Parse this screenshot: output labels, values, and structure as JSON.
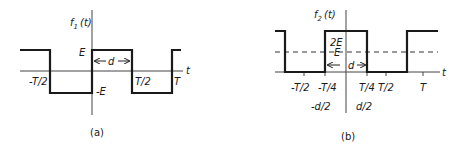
{
  "diagram_a": {
    "caption": "(a)",
    "y_label": "f",
    "y_label_sub": "1",
    "y_label_arg": "(t)",
    "x_label": "t",
    "labels": {
      "E": "E",
      "neg_E": "-E",
      "d": "d",
      "neg_half_T": "-T/2",
      "half_T": "T/2",
      "T": "T"
    },
    "waveform": {
      "type": "square wave",
      "high": "E",
      "low": "-E",
      "pulse_width": "d"
    }
  },
  "diagram_b": {
    "caption": "(b)",
    "y_label": "f",
    "y_label_sub": "2",
    "y_label_arg": "(t)",
    "x_label": "t",
    "labels": {
      "two_E": "2E",
      "E": "E",
      "d": "d",
      "neg_half_T": "-T/2",
      "neg_quarter_T": "-T/4",
      "quarter_T": "T/4",
      "half_T": "T/2",
      "T": "T",
      "neg_half_d": "-d/2",
      "half_d": "d/2"
    },
    "waveform": {
      "type": "pulse train",
      "high": "2E",
      "low": "0",
      "average_level": "E",
      "pulse_width": "d"
    }
  },
  "colors": {
    "line": "#1a1a1a",
    "axis": "#444444",
    "background": "#ffffff"
  }
}
